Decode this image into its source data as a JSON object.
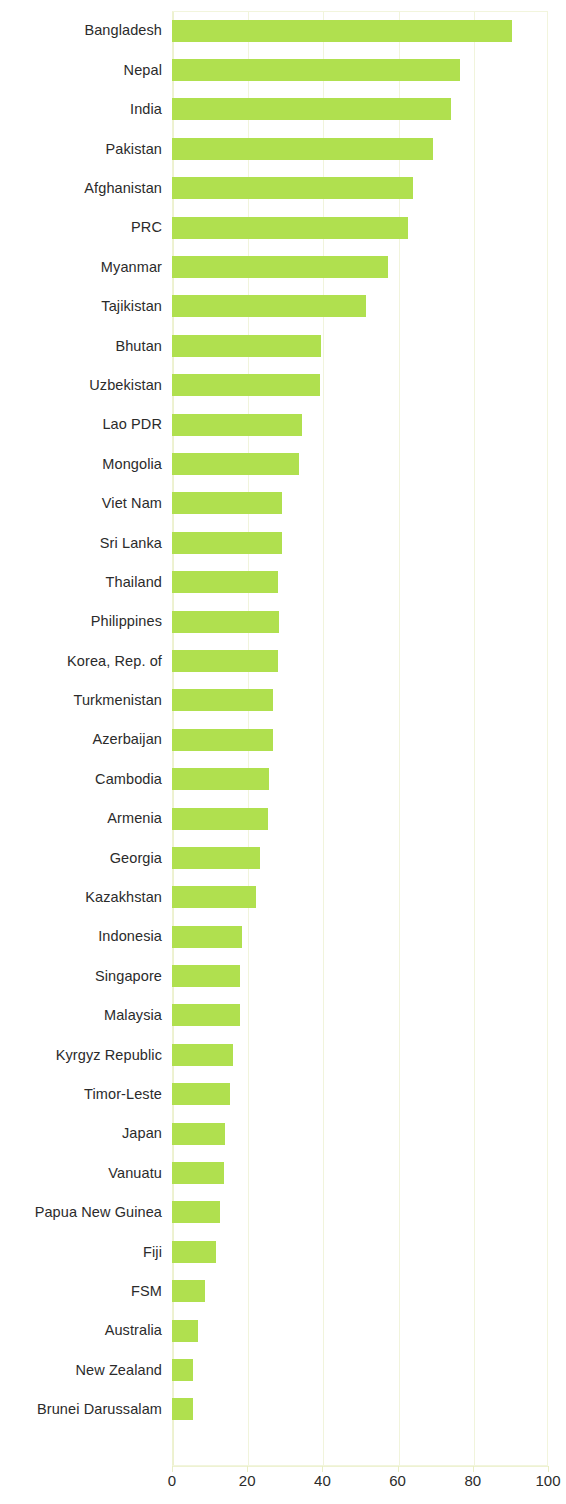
{
  "chart_data": {
    "type": "bar",
    "orientation": "horizontal",
    "title": "",
    "subtitle": "",
    "xlabel": "",
    "ylabel": "",
    "xlim": [
      0,
      100
    ],
    "xticks": [
      0,
      20,
      40,
      60,
      80,
      100
    ],
    "xtick_labels": [
      "0",
      "20",
      "40",
      "60",
      "80",
      "100"
    ],
    "grid": true,
    "legend": "none",
    "bar_color": "#b0e04f",
    "text_color": "#2b2b2b",
    "grid_color": "#f1f4dc",
    "categories": [
      "Bangladesh",
      "Nepal",
      "India",
      "Pakistan",
      "Afghanistan",
      "PRC",
      "Myanmar",
      "Tajikistan",
      "Bhutan",
      "Uzbekistan",
      "Lao PDR",
      "Mongolia",
      "Viet Nam",
      "Sri Lanka",
      "Thailand",
      "Philippines",
      "Korea, Rep. of",
      "Turkmenistan",
      "Azerbaijan",
      "Cambodia",
      "Armenia",
      "Georgia",
      "Kazakhstan",
      "Indonesia",
      "Singapore",
      "Malaysia",
      "Kyrgyz Republic",
      "Timor-Leste",
      "Japan",
      "Vanuatu",
      "Papua New Guinea",
      "Fiji",
      "FSM",
      "Australia",
      "New Zealand",
      "Brunei Darussalam"
    ],
    "values": [
      90.5,
      76.5,
      74.3,
      69.5,
      64.0,
      62.8,
      57.5,
      51.5,
      39.5,
      39.3,
      34.7,
      33.8,
      29.3,
      29.3,
      28.2,
      28.4,
      28.2,
      26.8,
      26.8,
      25.8,
      25.5,
      23.3,
      22.4,
      18.5,
      18.0,
      18.2,
      16.3,
      15.5,
      14.0,
      13.8,
      12.7,
      11.6,
      8.9,
      7.0,
      5.6,
      5.6
    ]
  }
}
